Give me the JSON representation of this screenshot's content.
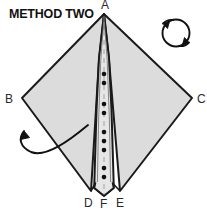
{
  "figure": {
    "title": "METHOD TWO",
    "kind": "origami-fold-diagram",
    "background_color": "#ffffff",
    "paper_fill_color": "#dcdcdc",
    "paper_fill_color_center": "#e6e6e6",
    "outline_color": "#1a1a1a",
    "label_color": "#2a2a2a"
  },
  "labels": {
    "a": "A",
    "b": "B",
    "c": "C",
    "d": "D",
    "f": "F",
    "e": "E"
  },
  "icons": {
    "flip_over_arrow": "circular-rotate-arrow",
    "fold_arrow": "curved-fold-arrow",
    "fold_line": "dotted-fold-line"
  },
  "geometry": {
    "vertex_a": [
      104,
      14
    ],
    "vertex_b": [
      22,
      98
    ],
    "vertex_c": [
      192,
      98
    ],
    "vertex_d": [
      91,
      191
    ],
    "vertex_f": [
      104,
      196
    ],
    "vertex_e": [
      120,
      191
    ],
    "fold_line_dots": 12
  }
}
